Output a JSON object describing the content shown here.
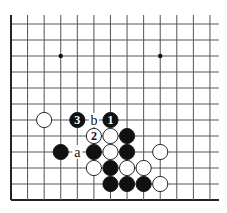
{
  "diagram": {
    "type": "go-board-fragment",
    "grid": {
      "columns": 13,
      "rows": 12,
      "x0": 11,
      "y0": 24,
      "dx": 16.58,
      "dy": 16,
      "extend_right": 9,
      "extend_top": 9,
      "edges": [
        "left",
        "bottom"
      ],
      "line_color": "#555555",
      "edge_color": "#222222"
    },
    "star_points": [
      {
        "col": 3,
        "row": 2
      },
      {
        "col": 9,
        "row": 2
      }
    ],
    "stones": [
      {
        "col": 2,
        "row": 6,
        "color": "white",
        "label": ""
      },
      {
        "col": 4,
        "row": 6,
        "color": "black",
        "label": "3"
      },
      {
        "col": 6,
        "row": 6,
        "color": "black",
        "label": "1"
      },
      {
        "col": 5,
        "row": 7,
        "color": "white",
        "label": "2"
      },
      {
        "col": 6,
        "row": 7,
        "color": "white",
        "label": ""
      },
      {
        "col": 7,
        "row": 7,
        "color": "black",
        "label": ""
      },
      {
        "col": 3,
        "row": 8,
        "color": "black",
        "label": ""
      },
      {
        "col": 5,
        "row": 8,
        "color": "black",
        "label": ""
      },
      {
        "col": 6,
        "row": 8,
        "color": "white",
        "label": ""
      },
      {
        "col": 7,
        "row": 8,
        "color": "black",
        "label": ""
      },
      {
        "col": 9,
        "row": 8,
        "color": "white",
        "label": ""
      },
      {
        "col": 5,
        "row": 9,
        "color": "white",
        "label": ""
      },
      {
        "col": 6,
        "row": 9,
        "color": "black",
        "label": ""
      },
      {
        "col": 7,
        "row": 9,
        "color": "white",
        "label": ""
      },
      {
        "col": 8,
        "row": 9,
        "color": "white",
        "label": ""
      },
      {
        "col": 6,
        "row": 10,
        "color": "black",
        "label": ""
      },
      {
        "col": 7,
        "row": 10,
        "color": "black",
        "label": ""
      },
      {
        "col": 8,
        "row": 10,
        "color": "black",
        "label": ""
      },
      {
        "col": 9,
        "row": 10,
        "color": "white",
        "label": ""
      }
    ],
    "point_labels": [
      {
        "col": 5,
        "row": 6,
        "text": "b"
      },
      {
        "col": 4,
        "row": 8,
        "text": "a"
      }
    ]
  }
}
